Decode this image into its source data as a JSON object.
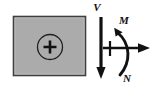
{
  "figure": {
    "background_color": "#ffffff"
  },
  "cross_section": {
    "name": "cross-section",
    "fill_color": "#ababab",
    "border_color": "#3a3a3a",
    "x": 13,
    "y": 16,
    "width": 73,
    "height": 60,
    "centroid": {
      "label": "+",
      "symbol_name": "circled-plus",
      "cx": 50,
      "cy": 47,
      "radius": 12,
      "color": "#1a1a1a"
    }
  },
  "resultants": [
    {
      "key": "shear",
      "label": "V",
      "description": "shear force",
      "direction": "down",
      "color": "#111111",
      "label_x": 97,
      "label_y": 11
    },
    {
      "key": "moment",
      "label": "M",
      "description": "bending moment",
      "direction": "counterclockwise-curved",
      "color": "#111111",
      "label_x": 124,
      "label_y": 24
    },
    {
      "key": "normal",
      "label": "N",
      "description": "normal axial force",
      "direction": "right",
      "color": "#111111",
      "label_x": 127,
      "label_y": 81
    }
  ],
  "geometry": {
    "shear_arrow": {
      "x": 101,
      "y_start": 17,
      "y_end": 78,
      "stroke_width": 3.2,
      "head_width": 9,
      "head_length": 10
    },
    "normal_arrow": {
      "y": 48,
      "x_start": 104,
      "x_end": 149,
      "stroke_width": 2.6,
      "head_width": 9,
      "head_length": 10
    },
    "moment_arc": {
      "start_x": 119,
      "start_y": 74,
      "end_x": 116,
      "end_y": 30,
      "bulge_x": 131,
      "stroke_width": 2.8,
      "head_width": 8,
      "head_length": 9
    },
    "tick_mark": {
      "x": 110,
      "y_top": 41,
      "y_bottom": 55,
      "stroke_width": 2.2
    }
  }
}
